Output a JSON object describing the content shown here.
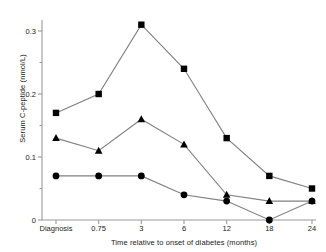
{
  "chart_data": {
    "type": "line",
    "title": "",
    "xlabel": "Time relative to onset of diabetes (months)",
    "ylabel": "Serum C-peptide (nmol/L)",
    "categories": [
      "Diagnosis",
      "0.75",
      "3",
      "6",
      "12",
      "18",
      "24"
    ],
    "ylim": [
      0,
      0.32
    ],
    "yticks": [
      0,
      0.1,
      0.2,
      0.3
    ],
    "ytick_labels": [
      "0",
      "0.1",
      "0.2",
      "0.3"
    ],
    "grid": false,
    "legend": "none",
    "line_color": "#808080",
    "marker_color": "#000000",
    "series": [
      {
        "name": "square-series",
        "marker": "square",
        "values": [
          0.17,
          0.2,
          0.31,
          0.24,
          0.13,
          0.07,
          0.05
        ]
      },
      {
        "name": "triangle-series",
        "marker": "triangle",
        "values": [
          0.13,
          0.11,
          0.16,
          0.12,
          0.04,
          0.03,
          0.03
        ]
      },
      {
        "name": "circle-series",
        "marker": "circle",
        "values": [
          0.07,
          0.07,
          0.07,
          0.04,
          0.03,
          0.0,
          0.03
        ]
      }
    ]
  },
  "axis": {
    "y_title": "Serum C-peptide (nmol/L)",
    "x_title": "Time relative to onset of diabetes (months)"
  }
}
